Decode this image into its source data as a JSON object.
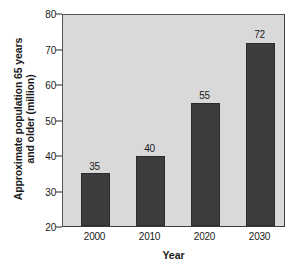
{
  "chart_data": {
    "type": "bar",
    "title": "",
    "xlabel": "Year",
    "ylabel": "Approximate population 65 years and older (million)",
    "ylabel_lines": [
      "Approximate population 65 years",
      "and older (million)"
    ],
    "categories": [
      "2000",
      "2010",
      "2020",
      "2030"
    ],
    "values": [
      35,
      40,
      55,
      72
    ],
    "value_labels": [
      "35",
      "40",
      "55",
      "72"
    ],
    "ylim": [
      20,
      80
    ],
    "yticks": [
      20,
      30,
      40,
      50,
      60,
      70,
      80
    ],
    "ytick_labels": [
      "20",
      "30",
      "40",
      "50",
      "60",
      "70",
      "80"
    ],
    "grid": false,
    "legend": null,
    "series": [
      {
        "name": "Approximate population 65 years and older (million)",
        "values": [
          35,
          40,
          55,
          72
        ]
      }
    ],
    "colors": {
      "bar": "#3d3d3d",
      "plot_background": "#d9d9d9",
      "figure_background": "#ffffff",
      "axis": "#2b2b2b",
      "text": "#1a1a1a"
    }
  }
}
